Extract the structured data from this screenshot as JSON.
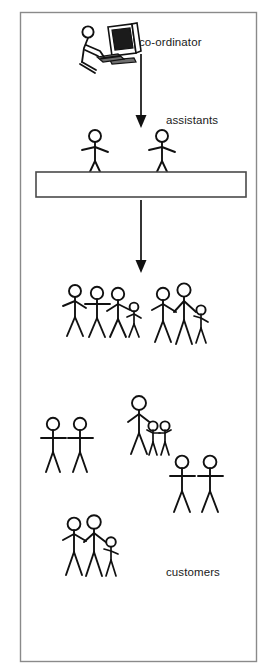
{
  "diagram": {
    "style": {
      "background": "#ffffff",
      "ink": "#111111",
      "frame_stroke": "#8a8a8a",
      "counter_stroke": "#4a4a4a"
    },
    "frame": {
      "name": "outer-border",
      "x": 20,
      "y": 12,
      "width": 237,
      "height": 650
    },
    "labels": [
      {
        "id": "coordinator",
        "text": "co-ordinator",
        "x": 139,
        "y": 36
      },
      {
        "id": "assistants",
        "text": "assistants",
        "x": 166,
        "y": 114
      },
      {
        "id": "customers",
        "text": "customers",
        "x": 166,
        "y": 566
      }
    ],
    "arrows": [
      {
        "id": "coordinator-to-assistants",
        "x": 141,
        "y1": 54,
        "y2": 127
      },
      {
        "id": "assistants-to-customers",
        "x": 141,
        "y1": 200,
        "y2": 272
      }
    ],
    "counter": {
      "name": "service-counter",
      "x": 36,
      "y": 172,
      "width": 210,
      "height": 25
    },
    "coordinator_figure": {
      "name": "coordinator-at-computer",
      "description": "person seated at a desktop computer monitor",
      "x": 72,
      "y": 24
    },
    "groups": [
      {
        "id": "assistants-row",
        "role": "assistants",
        "count": 2,
        "figures": [
          {
            "id": "assistant-1",
            "size": "adult",
            "x": 95,
            "y": 131
          },
          {
            "id": "assistant-2",
            "size": "adult",
            "x": 162,
            "y": 131
          }
        ]
      },
      {
        "id": "queue-group-left",
        "role": "customers",
        "count": 4,
        "figures": [
          {
            "id": "customer-1",
            "size": "adult",
            "x": 75,
            "y": 285
          },
          {
            "id": "customer-2",
            "size": "adult",
            "x": 97,
            "y": 286
          },
          {
            "id": "customer-3",
            "size": "adult",
            "x": 117,
            "y": 288
          },
          {
            "id": "customer-4",
            "size": "child",
            "x": 133,
            "y": 303
          }
        ]
      },
      {
        "id": "queue-group-right",
        "role": "customers",
        "count": 3,
        "figures": [
          {
            "id": "customer-5",
            "size": "adult",
            "x": 163,
            "y": 288
          },
          {
            "id": "customer-6",
            "size": "adult",
            "x": 183,
            "y": 284
          },
          {
            "id": "customer-7",
            "size": "child",
            "x": 200,
            "y": 305
          }
        ]
      },
      {
        "id": "pair-left",
        "role": "customers",
        "count": 2,
        "figures": [
          {
            "id": "customer-8",
            "size": "adult",
            "x": 53,
            "y": 418
          },
          {
            "id": "customer-9",
            "size": "adult",
            "x": 80,
            "y": 418
          }
        ]
      },
      {
        "id": "family-middle",
        "role": "customers",
        "count": 3,
        "figures": [
          {
            "id": "customer-10",
            "size": "adult",
            "x": 139,
            "y": 396
          },
          {
            "id": "customer-11",
            "size": "child",
            "x": 153,
            "y": 421
          },
          {
            "id": "customer-12",
            "size": "child",
            "x": 164,
            "y": 421
          }
        ]
      },
      {
        "id": "pair-right",
        "role": "customers",
        "count": 2,
        "figures": [
          {
            "id": "customer-13",
            "size": "adult",
            "x": 182,
            "y": 456
          },
          {
            "id": "customer-14",
            "size": "adult",
            "x": 209,
            "y": 456
          }
        ]
      },
      {
        "id": "family-bottom",
        "role": "customers",
        "count": 3,
        "figures": [
          {
            "id": "customer-15",
            "size": "adult",
            "x": 73,
            "y": 518
          },
          {
            "id": "customer-16",
            "size": "adult",
            "x": 93,
            "y": 516
          },
          {
            "id": "customer-17",
            "size": "child",
            "x": 110,
            "y": 537
          }
        ]
      }
    ],
    "totals": {
      "coordinators": 1,
      "assistants": 2,
      "customers": 17
    }
  }
}
